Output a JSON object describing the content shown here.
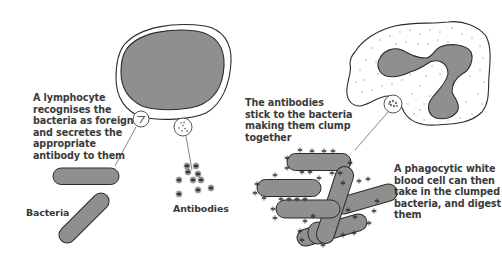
{
  "diagram": {
    "colors": {
      "outline": "#2b2b2b",
      "fill_gray": "#8f8f8f",
      "text": "#3a3a3a",
      "background": "#ffffff",
      "dots": "#9a9a9a"
    },
    "labels": {
      "lymphocyte": "A lymphocyte\nrecognises the\nbacteria as foreign\nand secretes the\nappropriate\nantibody to them",
      "bacteria": "Bacteria",
      "antibodies": "Antibodies",
      "clump": "The antibodies\nstick to the bacteria\nmaking them clump\ntogether",
      "phagocyte": "A phagocytic white\nblood cell can then\ntake in the clumped\nbacteria, and digest\nthem"
    },
    "nodes": [
      {
        "id": "lymphocyte",
        "shape": "ellipse-cell-with-nucleus"
      },
      {
        "id": "bacteria",
        "shape": "two-rod-bacteria"
      },
      {
        "id": "antibodies",
        "shape": "star-cluster"
      },
      {
        "id": "clump",
        "shape": "clumped-rods-with-antibodies"
      },
      {
        "id": "phagocyte",
        "shape": "amoeboid-cell-with-lobed-nucleus"
      }
    ]
  }
}
